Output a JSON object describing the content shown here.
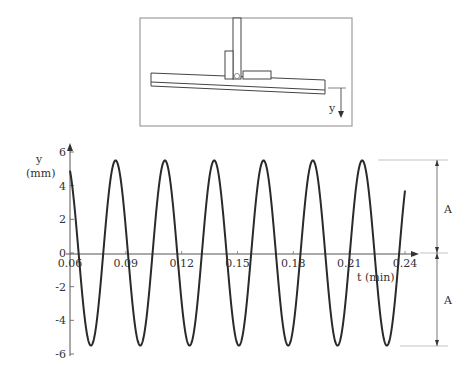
{
  "diagram": {
    "name": "seesaw-oscillator",
    "axis_label": "y",
    "colors": {
      "line": "#444444",
      "frame": "#888888"
    }
  },
  "chart_data": {
    "type": "line",
    "title": "",
    "xlabel": "t (min)",
    "ylabel": "y\n(mm)",
    "ylabel_lines": [
      "y",
      "(mm)"
    ],
    "xlim": [
      0.06,
      0.24
    ],
    "ylim": [
      -6,
      6
    ],
    "x_ticks": [
      "0.06",
      "0.09",
      "0.12",
      "0.15",
      "0.18",
      "0.21",
      "0.24"
    ],
    "y_ticks": [
      "6",
      "4",
      "2",
      "0",
      "-2",
      "-4",
      "-6"
    ],
    "grid": false,
    "series": [
      {
        "name": "displacement",
        "function": "y = A cos(2π (t - t0) / T)",
        "amplitude_mm": 5.5,
        "period_min": 0.0265,
        "t0_min": 0.058,
        "t_start": 0.06,
        "t_end": 0.24
      }
    ],
    "annotations": [
      {
        "text": "A",
        "meaning": "amplitude above equilibrium"
      },
      {
        "text": "A",
        "meaning": "amplitude below equilibrium"
      }
    ]
  }
}
